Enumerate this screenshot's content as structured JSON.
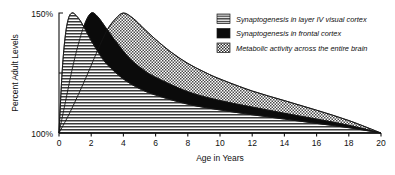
{
  "chart_data": {
    "type": "area",
    "title": "",
    "subtitle": "",
    "xlabel": "Age in Years",
    "ylabel": "Percent Adult Levels",
    "xlim": [
      0,
      20
    ],
    "ylim": [
      100,
      150
    ],
    "x_ticks": [
      0,
      2,
      4,
      6,
      8,
      10,
      12,
      14,
      16,
      18,
      20
    ],
    "x_tick_labels": [
      "0",
      "2",
      "4",
      "6",
      "8",
      "10",
      "12",
      "14",
      "16",
      "18",
      "20"
    ],
    "y_ticks": [
      100,
      125,
      150
    ],
    "y_tick_labels": [
      "100%",
      "",
      "150%"
    ],
    "y_tick_labels_visible": [
      "100%",
      "150%"
    ],
    "grid": false,
    "legend_position": "top-right",
    "series": [
      {
        "name": "Synaptogenesis in layer IV visual cortex",
        "fill": "horizontal-lines",
        "peak_x": 0.8,
        "peak_y": 150,
        "x": [
          0,
          0.2,
          0.4,
          0.6,
          0.8,
          1.0,
          1.3,
          1.6,
          2.0,
          2.5,
          3.0,
          4.0,
          5.0,
          6.0,
          8.0,
          10.0,
          12.0,
          14.0,
          16.0,
          18.0,
          20.0
        ],
        "values": [
          100,
          126,
          141,
          148,
          150,
          149.4,
          147,
          143.5,
          138.5,
          133,
          128.5,
          122.5,
          118.5,
          115.8,
          112,
          109.6,
          107.6,
          105.8,
          104,
          102.2,
          100
        ]
      },
      {
        "name": "Synaptogenesis in frontal cortex",
        "fill": "solid-black",
        "peak_x": 2.0,
        "peak_y": 150,
        "x": [
          0,
          0.4,
          0.8,
          1.2,
          1.6,
          2.0,
          2.4,
          3.0,
          3.6,
          4.4,
          5.2,
          6.0,
          8.0,
          10.0,
          12.0,
          14.0,
          16.0,
          18.0,
          20.0
        ],
        "values": [
          100,
          113,
          126,
          137,
          145.5,
          150,
          148.5,
          143,
          137.5,
          131,
          126.5,
          123.2,
          117.2,
          113.5,
          110.8,
          108.2,
          105.8,
          103.2,
          100
        ]
      },
      {
        "name": "Metabolic activity across the entire brain",
        "fill": "checkerboard",
        "peak_x": 4.0,
        "peak_y": 150,
        "x": [
          0,
          0.6,
          1.2,
          1.8,
          2.4,
          3.0,
          3.5,
          4.0,
          4.6,
          5.2,
          6.0,
          7.0,
          8.0,
          9.0,
          10.0,
          12.0,
          14.0,
          16.0,
          18.0,
          20.0
        ],
        "values": [
          100,
          107.5,
          116,
          125,
          134.5,
          143,
          147.5,
          150,
          147.8,
          144,
          139,
          133.5,
          129,
          125.5,
          122.5,
          117.5,
          113.5,
          109.5,
          105.2,
          100
        ]
      }
    ]
  },
  "legend": {
    "items": [
      {
        "label": "Synaptogenesis in layer IV visual cortex",
        "swatch": "horizontal-lines"
      },
      {
        "label": "Synaptogenesis in frontal cortex",
        "swatch": "solid-black"
      },
      {
        "label": "Metabolic activity across the entire brain",
        "swatch": "checkerboard"
      }
    ]
  },
  "colors": {
    "ink": "#111111",
    "axis": "#111111",
    "black_fill": "#0b0b0b",
    "pattern_stroke": "#2a2a2a",
    "background": "#ffffff"
  }
}
